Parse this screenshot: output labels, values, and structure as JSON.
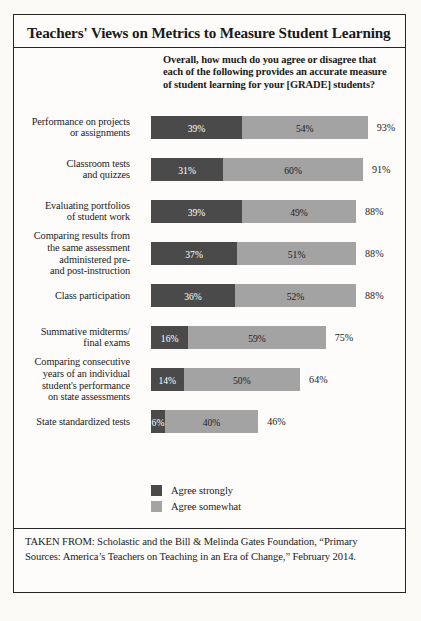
{
  "title": "Teachers' Views on Metrics to Measure Student Learning",
  "subtitle": "Overall, how much do you agree or disagree that each of the following provides an accurate measure of student learning for your [GRADE] students?",
  "legend": {
    "strong": "Agree strongly",
    "somewhat": "Agree somewhat"
  },
  "source": "TAKEN FROM: Scholastic and the Bill & Melinda Gates Foundation, “Primary Sources: America’s Teachers on Teaching in an Era of Change,” February 2014.",
  "colors": {
    "agree_strongly": "#4a4a4a",
    "agree_somewhat": "#a3a3a3",
    "frame": "#262626",
    "background": "#fdfcfa"
  },
  "chart_data": {
    "type": "bar",
    "orientation": "horizontal",
    "stacked": true,
    "title": "Teachers' Views on Metrics to Measure Student Learning",
    "subtitle": "Overall, how much do you agree or disagree that each of the following provides an accurate measure of student learning for your [GRADE] students?",
    "xlabel": "",
    "ylabel": "",
    "xlim": [
      0,
      100
    ],
    "unit": "%",
    "grid": false,
    "legend_position": "bottom-left",
    "categories": [
      "Performance on projects or assignments",
      "Classroom tests and quizzes",
      "Evaluating portfolios of student work",
      "Comparing results from the same assessment administered pre- and post-instruction",
      "Class participation",
      "Summative midterms/ final exams",
      "Comparing consecutive years of an individual student's performance on state assessments",
      "State standardized tests"
    ],
    "series": [
      {
        "name": "Agree strongly",
        "color": "#4a4a4a",
        "values": [
          39,
          31,
          39,
          37,
          36,
          16,
          14,
          6
        ]
      },
      {
        "name": "Agree somewhat",
        "color": "#a3a3a3",
        "values": [
          54,
          60,
          49,
          51,
          52,
          59,
          50,
          40
        ]
      }
    ],
    "totals": [
      93,
      91,
      88,
      88,
      88,
      75,
      64,
      46
    ]
  },
  "rows": [
    {
      "label_lines": [
        "Performance on projects",
        "or assignments"
      ],
      "strong": "39%",
      "somewhat": "54%",
      "total": "93%",
      "strong_w": 39,
      "somewhat_w": 54
    },
    {
      "label_lines": [
        "Classroom tests",
        "and quizzes"
      ],
      "strong": "31%",
      "somewhat": "60%",
      "total": "91%",
      "strong_w": 31,
      "somewhat_w": 60
    },
    {
      "label_lines": [
        "Evaluating portfolios",
        "of student work"
      ],
      "strong": "39%",
      "somewhat": "49%",
      "total": "88%",
      "strong_w": 39,
      "somewhat_w": 49
    },
    {
      "label_lines": [
        "Comparing results from",
        "the same assessment",
        "administered pre-",
        "and post-instruction"
      ],
      "strong": "37%",
      "somewhat": "51%",
      "total": "88%",
      "strong_w": 37,
      "somewhat_w": 51
    },
    {
      "label_lines": [
        "Class participation"
      ],
      "strong": "36%",
      "somewhat": "52%",
      "total": "88%",
      "strong_w": 36,
      "somewhat_w": 52
    },
    {
      "label_lines": [
        "Summative midterms/",
        "final exams"
      ],
      "strong": "16%",
      "somewhat": "59%",
      "total": "75%",
      "strong_w": 16,
      "somewhat_w": 59
    },
    {
      "label_lines": [
        "Comparing consecutive",
        "years of an individual",
        "student's performance",
        "on state assessments"
      ],
      "strong": "14%",
      "somewhat": "50%",
      "total": "64%",
      "strong_w": 14,
      "somewhat_w": 50
    },
    {
      "label_lines": [
        "State standardized tests"
      ],
      "strong": "6%",
      "somewhat": "40%",
      "total": "46%",
      "strong_w": 6,
      "somewhat_w": 40
    }
  ]
}
